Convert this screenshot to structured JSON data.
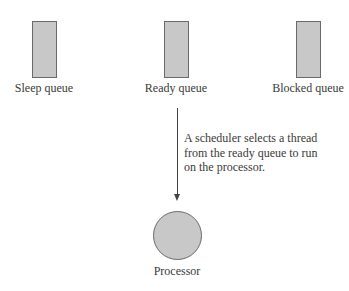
{
  "diagram": {
    "queues": [
      {
        "label": "Sleep queue",
        "center_x": 44
      },
      {
        "label": "Ready queue",
        "center_x": 176
      },
      {
        "label": "Blocked queue",
        "center_x": 308
      }
    ],
    "annotation": {
      "lines": [
        "A scheduler selects a thread",
        "from the ready queue to run",
        "on the processor."
      ]
    },
    "processor": {
      "label": "Processor"
    },
    "colors": {
      "fill": "#c8c8c8",
      "stroke": "#6a6a6a",
      "text": "#3a3a3a"
    }
  }
}
